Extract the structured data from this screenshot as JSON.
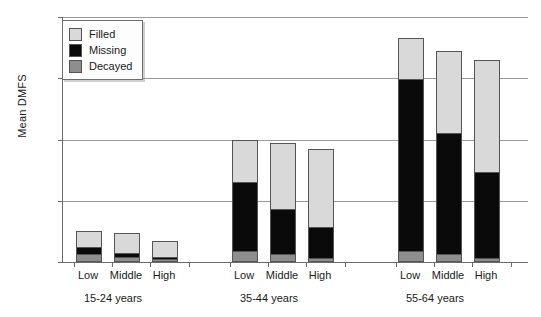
{
  "chart_data": {
    "type": "bar",
    "title": "",
    "xlabel": "",
    "ylabel": "Mean DMFS",
    "ylim": [
      0,
      80
    ],
    "yticks": [
      0,
      20,
      40,
      60,
      80
    ],
    "grid": true,
    "stacked": true,
    "legend_position": "top-left",
    "legend": [
      "Filled",
      "Missing",
      "Decayed"
    ],
    "groups": [
      {
        "label": "15-24 years",
        "categories": [
          "Low",
          "Middle",
          "High"
        ],
        "bars": [
          {
            "category": "Low",
            "decayed": 2.0,
            "missing": 2.5,
            "filled": 5.5,
            "total": 10.0
          },
          {
            "category": "Middle",
            "decayed": 1.0,
            "missing": 1.5,
            "filled": 7.0,
            "total": 9.5
          },
          {
            "category": "High",
            "decayed": 0.5,
            "missing": 0.7,
            "filled": 5.8,
            "total": 7.0
          }
        ]
      },
      {
        "label": "35-44 years",
        "categories": [
          "Low",
          "Middle",
          "High"
        ],
        "bars": [
          {
            "category": "Low",
            "decayed": 3.0,
            "missing": 23.0,
            "filled": 14.0,
            "total": 40.0
          },
          {
            "category": "Middle",
            "decayed": 2.0,
            "missing": 15.0,
            "filled": 22.0,
            "total": 39.0
          },
          {
            "category": "High",
            "decayed": 0.8,
            "missing": 10.2,
            "filled": 26.0,
            "total": 37.0
          }
        ]
      },
      {
        "label": "55-64 years",
        "categories": [
          "Low",
          "Middle",
          "High"
        ],
        "bars": [
          {
            "category": "Low",
            "decayed": 3.0,
            "missing": 56.5,
            "filled": 13.5,
            "total": 73.0
          },
          {
            "category": "Middle",
            "decayed": 2.0,
            "missing": 40.0,
            "filled": 27.0,
            "total": 69.0
          },
          {
            "category": "High",
            "decayed": 0.5,
            "missing": 28.5,
            "filled": 37.0,
            "total": 66.0
          }
        ]
      }
    ],
    "colors": {
      "filled": "#d9d9d9",
      "missing": "#0a0a0a",
      "decayed": "#8e8e8e",
      "axis": "#6b6b6b",
      "grid": "#9a9a9a"
    }
  },
  "layout": {
    "plot_left": 62,
    "plot_top": 17,
    "plot_width": 465,
    "plot_height": 245,
    "bar_width": 26,
    "bar_x": [
      75,
      113,
      151,
      231,
      269,
      307,
      397,
      435,
      473
    ],
    "group_center_x": [
      113,
      269,
      435
    ]
  }
}
